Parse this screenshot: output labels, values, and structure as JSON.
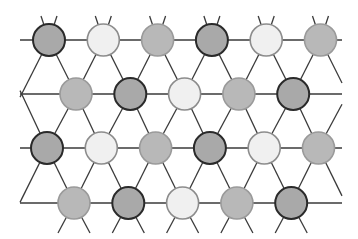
{
  "diagram": {
    "type": "triangular-lattice",
    "colors": {
      "edge": "#3a3a3a",
      "dark": {
        "fill": "#a9a9a9",
        "stroke": "#2a2a2a"
      },
      "medium": {
        "fill": "#b8b8b8",
        "stroke": "#9a9a9a"
      },
      "light": {
        "fill": "#f0f0f0",
        "stroke": "#8c8c8c"
      }
    },
    "radius": 16,
    "rows": [
      {
        "y": 40,
        "x0": 49,
        "nodes": [
          "dark",
          "light",
          "medium",
          "dark",
          "light",
          "medium"
        ]
      },
      {
        "y": 94,
        "x0": 76,
        "nodes": [
          "medium",
          "dark",
          "light",
          "medium",
          "dark"
        ]
      },
      {
        "y": 148,
        "x0": 47,
        "nodes": [
          "dark",
          "light",
          "medium",
          "dark",
          "light",
          "medium"
        ]
      },
      {
        "y": 203,
        "x0": 74,
        "nodes": [
          "medium",
          "dark",
          "light",
          "medium",
          "dark"
        ]
      }
    ],
    "spacing": 54.3,
    "left_x": 20,
    "right_x": 342
  }
}
